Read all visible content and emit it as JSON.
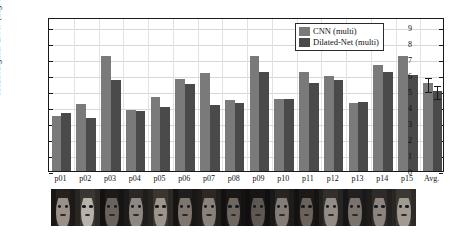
{
  "chart_data": {
    "type": "bar",
    "title": "",
    "xlabel": "",
    "ylabel": "Mean Angular Error (degree)",
    "ylim": [
      0,
      9.6
    ],
    "yticks": [
      0,
      1,
      2,
      3,
      4,
      5,
      6,
      7,
      8,
      9
    ],
    "grid": true,
    "legend_position": "top-right",
    "categories": [
      "p01",
      "p02",
      "p03",
      "p04",
      "p05",
      "p06",
      "p07",
      "p08",
      "p09",
      "p10",
      "p11",
      "p12",
      "p13",
      "p14",
      "p15",
      "Avg."
    ],
    "series": [
      {
        "name": "CNN (multi)",
        "color": "#7a7a7a",
        "values": [
          3.4,
          4.2,
          7.15,
          3.8,
          4.6,
          5.75,
          6.1,
          4.4,
          7.15,
          4.5,
          6.2,
          5.9,
          4.25,
          6.6,
          7.2,
          5.5
        ],
        "errors": [
          0,
          0,
          0,
          0,
          0,
          0,
          0,
          0,
          0,
          0,
          0,
          0,
          0,
          0,
          0,
          0.45
        ]
      },
      {
        "name": "Dilated-Net (multi)",
        "color": "#4a4a4a",
        "values": [
          3.6,
          3.3,
          5.7,
          3.75,
          4.0,
          5.4,
          4.1,
          4.25,
          6.2,
          4.5,
          5.5,
          5.7,
          4.3,
          6.15,
          6.0,
          5.0
        ],
        "errors": [
          0,
          0,
          0,
          0,
          0,
          0,
          0,
          0,
          0,
          0,
          0,
          0,
          0,
          0,
          0,
          0.4
        ]
      }
    ]
  },
  "legend": {
    "entries": [
      {
        "label": "CNN (multi)",
        "color": "#7a7a7a"
      },
      {
        "label": "Dilated-Net (multi)",
        "color": "#4a4a4a"
      }
    ]
  },
  "face_strip": {
    "count": 15,
    "faces": [
      {
        "skin": "#9a9088",
        "hair": "#24211f",
        "tone": "light"
      },
      {
        "skin": "#b9b2a8",
        "hair": "#3a3632",
        "tone": "light"
      },
      {
        "skin": "#6a625c",
        "hair": "#1d1b19",
        "tone": "dark"
      },
      {
        "skin": "#8f8880",
        "hair": "#2a2724",
        "tone": "mid"
      },
      {
        "skin": "#9d958c",
        "hair": "#3a352f",
        "tone": "light"
      },
      {
        "skin": "#7e766e",
        "hair": "#201e1c",
        "tone": "mid"
      },
      {
        "skin": "#8a827a",
        "hair": "#2b2825",
        "tone": "mid"
      },
      {
        "skin": "#6f675f",
        "hair": "#1a1817",
        "tone": "dark"
      },
      {
        "skin": "#5f5852",
        "hair": "#171515",
        "tone": "dark"
      },
      {
        "skin": "#857d75",
        "hair": "#272421",
        "tone": "mid"
      },
      {
        "skin": "#6b635b",
        "hair": "#1c1a18",
        "tone": "dark"
      },
      {
        "skin": "#948c84",
        "hair": "#33302c",
        "tone": "light"
      },
      {
        "skin": "#7b736b",
        "hair": "#222020",
        "tone": "mid"
      },
      {
        "skin": "#8d857d",
        "hair": "#2e2b28",
        "tone": "mid"
      },
      {
        "skin": "#a29a91",
        "hair": "#3b3733",
        "tone": "light"
      }
    ]
  }
}
